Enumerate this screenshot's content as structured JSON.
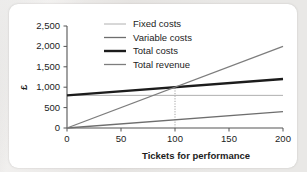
{
  "card": {
    "background_color": "#ffffff",
    "page_background_color": "#e9e8e6"
  },
  "chart_data": {
    "type": "line",
    "title": "",
    "xlabel": "Tickets for performance",
    "ylabel": "£",
    "xlim": [
      0,
      200
    ],
    "ylim": [
      0,
      2500
    ],
    "xticks": [
      0,
      50,
      100,
      150,
      200
    ],
    "xtick_labels": [
      "0",
      "50",
      "100",
      "150",
      "200"
    ],
    "yticks": [
      0,
      500,
      1000,
      1500,
      2000,
      2500
    ],
    "ytick_labels": [
      "0",
      "500",
      "1,000",
      "1,500",
      "2,000",
      "2,500"
    ],
    "grid": false,
    "legend_position": "top-center",
    "series": [
      {
        "name": "Fixed costs",
        "x": [
          0,
          200
        ],
        "values": [
          800,
          800
        ],
        "color": "#b0b0b0",
        "width": 1.0
      },
      {
        "name": "Variable costs",
        "x": [
          0,
          200
        ],
        "values": [
          0,
          400
        ],
        "color": "#6e6e6e",
        "width": 1.3
      },
      {
        "name": "Total costs",
        "x": [
          0,
          200
        ],
        "values": [
          800,
          1200
        ],
        "color": "#1c1c1c",
        "width": 2.4
      },
      {
        "name": "Total revenue",
        "x": [
          0,
          200
        ],
        "values": [
          0,
          2000
        ],
        "color": "#7d7d7d",
        "width": 1.3
      }
    ],
    "annotations": [
      {
        "name": "break-even-guide",
        "type": "vertical-dotted-line",
        "x": 100,
        "y_from": 0,
        "y_to": 1000,
        "color": "#9a9a9a"
      }
    ]
  },
  "legend": {
    "items": [
      {
        "label": "Fixed costs"
      },
      {
        "label": "Variable costs"
      },
      {
        "label": "Total costs"
      },
      {
        "label": "Total revenue"
      }
    ]
  }
}
